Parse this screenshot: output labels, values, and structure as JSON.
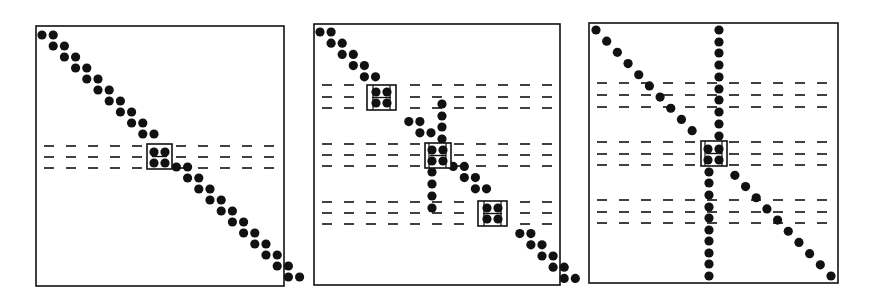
{
  "figure": {
    "colors": {
      "ink": "#111111",
      "background": "#ffffff"
    },
    "dot_radius": 4.6,
    "dash": {
      "length": 10,
      "pitch": 22
    },
    "panels": [
      {
        "id": "panel-1",
        "frame": {
          "x": 36,
          "y": 26,
          "w": 248,
          "h": 260
        },
        "diagonal_pairs": {
          "x0": 42,
          "y0": 35,
          "dx": 11.2,
          "dy": 11.0,
          "count": 23,
          "pair_dx": 11.2
        },
        "dash_bands": [
          {
            "rows": [
              146,
              157,
              168
            ]
          }
        ],
        "boxes": [
          {
            "x": 147,
            "y": 144,
            "w": 25,
            "h": 25,
            "dots": [
              [
                154,
                152
              ],
              [
                165,
                152
              ],
              [
                154,
                163
              ],
              [
                165,
                163
              ]
            ],
            "grid": false
          }
        ],
        "columns": [],
        "skip_diagonal_rows": [
          10
        ]
      },
      {
        "id": "panel-2",
        "frame": {
          "x": 314,
          "y": 24,
          "w": 246,
          "h": 261
        },
        "diagonal_pairs": {
          "x0": 320,
          "y0": 32,
          "dx": 11.1,
          "dy": 11.2,
          "count": 23,
          "pair_dx": 11.1
        },
        "dash_bands": [
          {
            "rows": [
              85,
              97,
              108
            ]
          },
          {
            "rows": [
              144,
              155,
              166
            ]
          },
          {
            "rows": [
              202,
              213,
              224
            ]
          }
        ],
        "boxes": [
          {
            "x": 367,
            "y": 85,
            "w": 29,
            "h": 25,
            "dots": [
              [
                376,
                92
              ],
              [
                387,
                92
              ],
              [
                376,
                103
              ],
              [
                387,
                103
              ]
            ],
            "grid": true
          },
          {
            "x": 425,
            "y": 143,
            "w": 26,
            "h": 25,
            "dots": [
              [
                432,
                150
              ],
              [
                443,
                150
              ],
              [
                432,
                161
              ],
              [
                443,
                161
              ]
            ],
            "grid": true
          },
          {
            "x": 478,
            "y": 201,
            "w": 29,
            "h": 25,
            "dots": [
              [
                487,
                208
              ],
              [
                498,
                208
              ],
              [
                487,
                219
              ],
              [
                498,
                219
              ]
            ],
            "grid": true
          }
        ],
        "columns": [
          {
            "x": 442,
            "ys": [
              104,
              116,
              127,
              139
            ]
          },
          {
            "x": 432,
            "ys": [
              172,
              184,
              196,
              208
            ]
          }
        ],
        "skip_diagonal_rows": [
          5,
          10,
          15
        ]
      },
      {
        "id": "panel-3",
        "frame": {
          "x": 589,
          "y": 23,
          "w": 249,
          "h": 260
        },
        "diagonal_single": {
          "x0": 596,
          "y0": 30,
          "x1": 831,
          "y1": 276,
          "count": 23
        },
        "dash_bands": [
          {
            "rows": [
              83,
              95,
              107
            ]
          },
          {
            "rows": [
              142,
              154,
              165
            ]
          },
          {
            "rows": [
              200,
              212,
              223
            ]
          }
        ],
        "boxes": [
          {
            "x": 701,
            "y": 141,
            "w": 26,
            "h": 25,
            "dots": [
              [
                708,
                149
              ],
              [
                719,
                149
              ],
              [
                708,
                160
              ],
              [
                719,
                160
              ]
            ],
            "grid": true
          }
        ],
        "columns": [
          {
            "x": 719,
            "ys": [
              30,
              42,
              53,
              65,
              77,
              89,
              100,
              112,
              124,
              136
            ]
          },
          {
            "x": 709,
            "ys": [
              172,
              183,
              195,
              207,
              218,
              230,
              241,
              253,
              264,
              276
            ]
          }
        ],
        "skip_diagonal_rows": [
          11
        ]
      }
    ]
  }
}
